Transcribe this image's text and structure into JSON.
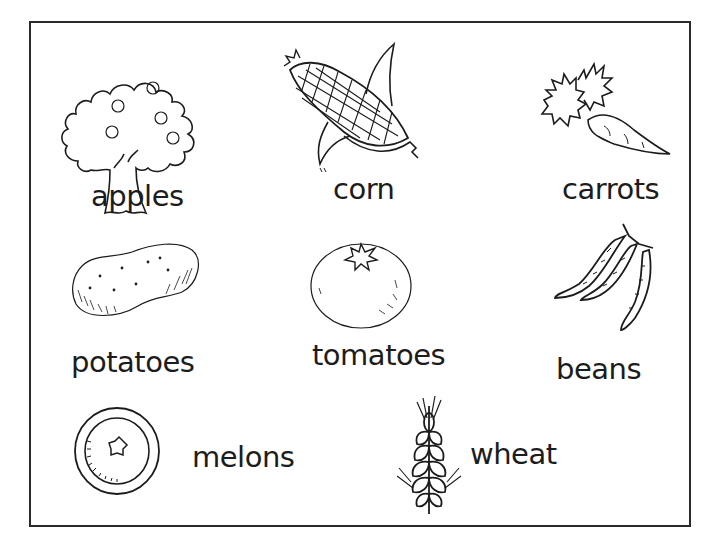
{
  "worksheet": {
    "items": [
      {
        "id": "apples",
        "label": "apples",
        "icon": "apple-tree-icon"
      },
      {
        "id": "corn",
        "label": "corn",
        "icon": "corn-cob-icon"
      },
      {
        "id": "carrots",
        "label": "carrots",
        "icon": "carrot-icon"
      },
      {
        "id": "potatoes",
        "label": "potatoes",
        "icon": "potato-icon"
      },
      {
        "id": "tomatoes",
        "label": "tomatoes",
        "icon": "tomato-icon"
      },
      {
        "id": "beans",
        "label": "beans",
        "icon": "bean-pods-icon"
      },
      {
        "id": "melons",
        "label": "melons",
        "icon": "melon-slice-icon"
      },
      {
        "id": "wheat",
        "label": "wheat",
        "icon": "wheat-stalk-icon"
      }
    ]
  },
  "colors": {
    "ink": "#1c1c1c",
    "background": "#ffffff",
    "border": "#2a2a2a"
  }
}
